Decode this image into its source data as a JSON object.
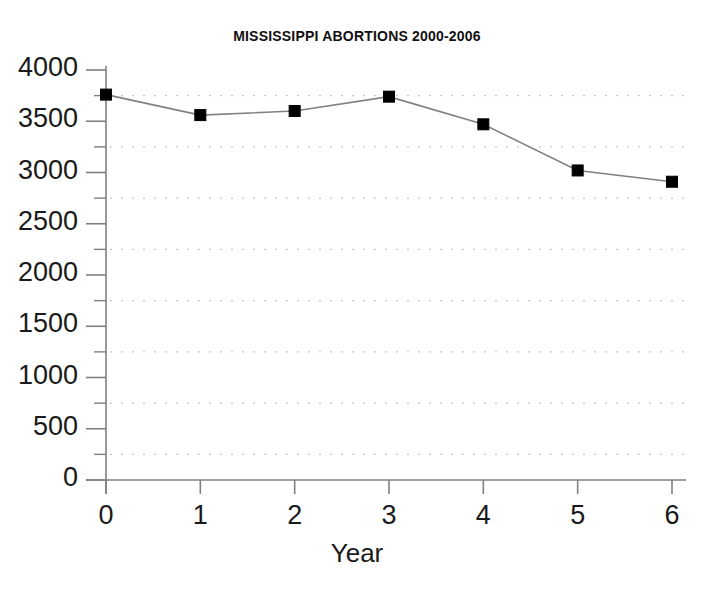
{
  "chart_data": {
    "type": "line",
    "title": "MISSISSIPPI ABORTIONS 2000-2006",
    "xlabel": "Year",
    "ylabel": "",
    "x": [
      0,
      1,
      2,
      3,
      4,
      5,
      6
    ],
    "values": [
      3760,
      3560,
      3600,
      3740,
      3470,
      3020,
      2910
    ],
    "series": [
      {
        "name": "Abortions",
        "values": [
          3760,
          3560,
          3600,
          3740,
          3470,
          3020,
          2910
        ]
      }
    ],
    "xlim": [
      0,
      6
    ],
    "ylim": [
      0,
      4000
    ],
    "ytick_labels": [
      "0",
      "500",
      "1000",
      "1500",
      "2000",
      "2500",
      "3000",
      "3500",
      "4000"
    ],
    "ytick_values": [
      0,
      500,
      1000,
      1500,
      2000,
      2500,
      3000,
      3500,
      4000
    ],
    "xtick_labels": [
      "0",
      "1",
      "2",
      "3",
      "4",
      "5",
      "6"
    ],
    "xtick_values": [
      0,
      1,
      2,
      3,
      4,
      5,
      6
    ],
    "gridlines": {
      "enabled": true,
      "orientation": "horizontal",
      "style": "dotted",
      "y_values": [
        250,
        750,
        1250,
        1750,
        2250,
        2750,
        3250,
        3750
      ],
      "color": "#c8c8c8"
    },
    "legend": null,
    "marker": "square",
    "marker_color": "#000000",
    "line_color": "#808080",
    "background_color": "#ffffff",
    "axis_color": "#808080"
  },
  "labels": {
    "title": "MISSISSIPPI ABORTIONS 2000-2006",
    "xaxis_title": "Year"
  }
}
